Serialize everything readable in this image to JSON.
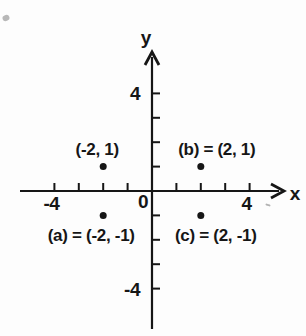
{
  "figure": {
    "background": "#fdfdfd",
    "ink": "#161616"
  },
  "chart_data": {
    "type": "scatter",
    "title": "",
    "xlabel": "x",
    "ylabel": "y",
    "origin_label": "0",
    "xlim": [
      -5.4,
      5.4
    ],
    "ylim": [
      -5.9,
      5.8
    ],
    "grid": false,
    "x_ticks": [
      -4,
      -3,
      -2,
      -1,
      1,
      2,
      3,
      4
    ],
    "y_ticks": [
      -4,
      -3,
      -2,
      -1,
      1,
      2,
      3,
      4
    ],
    "x_tick_labels": [
      {
        "value": -4,
        "label": "-4"
      },
      {
        "value": 4,
        "label": "4"
      }
    ],
    "y_tick_labels": [
      {
        "value": 4,
        "label": "4"
      },
      {
        "value": -4,
        "label": "-4"
      }
    ],
    "points": [
      {
        "x": -2,
        "y": 1,
        "label": "(-2, 1)",
        "label_position": "above",
        "label_dx": -6
      },
      {
        "x": 2,
        "y": 1,
        "label": "(b) = (2, 1)",
        "label_position": "above",
        "label_dx": 16
      },
      {
        "x": -2,
        "y": -1,
        "label": "(a) = (-2, -1)",
        "label_position": "below",
        "label_dx": -12
      },
      {
        "x": 2,
        "y": -1,
        "label": "(c) = (2, -1)",
        "label_position": "below",
        "label_dx": 15
      }
    ],
    "layout": {
      "origin_px": [
        152,
        191
      ],
      "unit_px": 24.4,
      "x_axis_start_px": 20,
      "x_axis_tip_px": 284,
      "y_axis_tip_px": 52,
      "y_axis_end_px": 329,
      "tick_len_px": 8,
      "point_radius_px": 3.5,
      "label_above_dy": -12,
      "label_below_dy": 26,
      "x_title_px": [
        295,
        200
      ],
      "y_title_px": [
        146,
        44
      ],
      "origin_label_px": [
        143,
        208
      ],
      "x_tick_label_dy": 19,
      "x_tick_label_dx": -3,
      "y_tick_label_x": 140,
      "y_tick_label_dy": 7
    }
  },
  "artifacts": [
    {
      "kind": "smudge",
      "x": 6,
      "y": 18,
      "w": 7,
      "h": 6
    },
    {
      "kind": "dash",
      "x": 268,
      "y": 205,
      "w": 5,
      "h": 2
    }
  ]
}
